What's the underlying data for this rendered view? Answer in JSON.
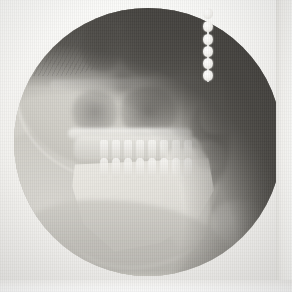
{
  "image": {
    "modality": "Lateral Cephalometric Radiograph",
    "view": "Lateral (profile), patient facing right",
    "width_px": 292,
    "height_px": 292,
    "colorspace": "grayscale",
    "caption": "Lateral cephalometric radiograph of the skull showing cranial vault, maxilla, mandible, dentition and soft-tissue facial profile, with a radiopaque bead-chain marker over the posterior region."
  },
  "field": {
    "shape": "circle",
    "label": "circular-collimation-field",
    "center_x": 148,
    "center_y": 142,
    "radius": 134,
    "inside_tone": "#b9b7b1",
    "outside_tone": "#4a4844"
  },
  "margins": {
    "right_strip_label": "film-right-margin",
    "right_strip_x": 276,
    "bottom_band_label": "film-bottom-margin",
    "bottom_band_y": 280,
    "margin_tone": "#fbfbf9"
  },
  "marker": {
    "name": "bead-chain-marker",
    "description": "Vertical radiopaque bead chain used as a reference / positioning marker",
    "bead_count": 6,
    "center_x": 208,
    "top_y": 8,
    "bottom_y": 72,
    "bead_tone": "#f8f7f4",
    "beads_y": [
      8,
      21,
      34,
      46,
      58,
      70
    ]
  },
  "anatomy": {
    "regions": [
      {
        "name": "cranial-vault",
        "label": "Cranial vault",
        "x": 20,
        "y": 10,
        "tone": "#d4d2cb"
      },
      {
        "name": "orbital-cavity",
        "label": "Orbital cavity",
        "x": 108,
        "y": 36,
        "tone": "#76746f"
      },
      {
        "name": "cranial-base",
        "label": "Cranial base",
        "x": 110,
        "y": 78,
        "tone": "#eeedea"
      },
      {
        "name": "maxillary-sinus",
        "label": "Maxillary sinus / antrum",
        "x": 126,
        "y": 104,
        "tone": "#706e6a"
      },
      {
        "name": "hard-palate",
        "label": "Hard palate",
        "x": 118,
        "y": 126,
        "tone": "#f3f2ee"
      },
      {
        "name": "maxillary-dentition",
        "label": "Maxillary dentition",
        "x": 132,
        "y": 140,
        "tone": "#f7f6f2"
      },
      {
        "name": "mandibular-dentition",
        "label": "Mandibular dentition",
        "x": 130,
        "y": 158,
        "tone": "#f2f1ed"
      },
      {
        "name": "mandible-body",
        "label": "Mandibular body",
        "x": 120,
        "y": 196,
        "tone": "#e8e6e0"
      },
      {
        "name": "mandibular-ramus",
        "label": "Mandibular ramus",
        "x": 172,
        "y": 186,
        "tone": "#dcdad4"
      },
      {
        "name": "pharyngeal-airway",
        "label": "Pharyngeal airway",
        "x": 196,
        "y": 138,
        "tone": "#605e5a"
      },
      {
        "name": "soft-tissue-profile",
        "label": "Soft-tissue facial profile",
        "x": 200,
        "y": 120,
        "tone": "#c9c7c0"
      },
      {
        "name": "nasal-soft-tissue",
        "label": "Nose",
        "x": 202,
        "y": 104,
        "tone": "#d2d0ca"
      },
      {
        "name": "lip-soft-tissue",
        "label": "Lips",
        "x": 196,
        "y": 146,
        "tone": "#cecbc5"
      },
      {
        "name": "chin-soft-tissue",
        "label": "Chin / menton",
        "x": 180,
        "y": 220,
        "tone": "#dedcd6"
      },
      {
        "name": "neck-soft-tissue",
        "label": "Neck",
        "x": 90,
        "y": 262,
        "tone": "#c2c0ba"
      },
      {
        "name": "scalp-hair",
        "label": "Scalp and hair",
        "x": 40,
        "y": 22,
        "tone": "#c8c6c0"
      }
    ],
    "teeth": {
      "upper_count": 8,
      "lower_count": 8,
      "upper_y": 132,
      "lower_y": 150,
      "start_x": 86,
      "spacing": 12
    }
  },
  "palette": {
    "film_white": "#fbfbf9",
    "bone_bright": "#f3f2ee",
    "soft_tissue_mid": "#cbc9c2",
    "field_mid": "#b9b7b1",
    "cavity_dark": "#76746f",
    "background_dark": "#4a4844"
  }
}
